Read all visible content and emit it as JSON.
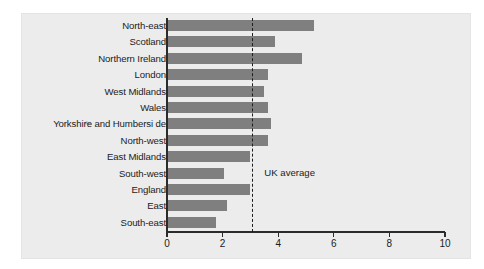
{
  "chart_data": {
    "type": "bar",
    "orientation": "horizontal",
    "title": "",
    "subtitle": "",
    "xlabel": "",
    "ylabel": "",
    "categories": [
      "North-east",
      "Scotland",
      "Northern Ireland",
      "London",
      "West Midlands",
      "Wales",
      "Yorkshire and Humbersi de",
      "North-west",
      "East Midlands",
      "South-west",
      "England",
      "East",
      "South-east"
    ],
    "values": [
      5.3,
      3.9,
      4.85,
      3.65,
      3.5,
      3.65,
      3.75,
      3.65,
      3.0,
      2.05,
      3.0,
      2.15,
      1.75
    ],
    "xlim": [
      0,
      10
    ],
    "xticks": [
      0,
      2,
      4,
      6,
      8,
      10
    ],
    "xtick_labels": [
      "0",
      "2",
      "4",
      "6",
      "8",
      "10"
    ],
    "grid": false,
    "legend": false,
    "bar_color": "#7f7f7f",
    "annotations": [
      {
        "type": "reference-line",
        "label": "UK average",
        "value": 3.07,
        "style": "dashed",
        "color": "#1d1d1d"
      }
    ],
    "row_markers": [
      {
        "category": "Yorkshire and Humbersi de",
        "glyph": "✁"
      }
    ]
  },
  "colors": {
    "bar": "#7f7f7f",
    "axis": "#2b2b2b",
    "text": "#1b1b1b",
    "plate": "#ececed",
    "page": "#ffffff"
  }
}
